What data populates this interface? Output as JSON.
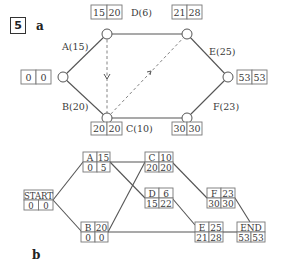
{
  "question_number": "5",
  "part_a": {
    "label": "a",
    "events": [
      {
        "id": "start",
        "early": "0",
        "late": "0"
      },
      {
        "id": "top-left",
        "early": "15",
        "late": "20"
      },
      {
        "id": "top-right",
        "early": "21",
        "late": "28"
      },
      {
        "id": "bottom-left",
        "early": "20",
        "late": "20"
      },
      {
        "id": "bottom-right",
        "early": "30",
        "late": "30"
      },
      {
        "id": "end",
        "early": "53",
        "late": "53"
      }
    ],
    "activities": [
      {
        "label": "A(15)",
        "from": "start",
        "to": "top-left"
      },
      {
        "label": "B(20)",
        "from": "start",
        "to": "bottom-left"
      },
      {
        "label": "D(6)",
        "from": "top-left",
        "to": "top-right"
      },
      {
        "label": "C(10)",
        "from": "bottom-left",
        "to": "bottom-right"
      },
      {
        "label": "E(25)",
        "from": "top-right",
        "to": "end"
      },
      {
        "label": "F(23)",
        "from": "bottom-right",
        "to": "end"
      }
    ],
    "dummies": [
      {
        "from": "top-left",
        "to": "bottom-left"
      },
      {
        "from": "bottom-left",
        "to": "top-right"
      }
    ]
  },
  "part_b": {
    "label": "b",
    "nodes": {
      "start": {
        "name": "START",
        "duration": "",
        "est": "0",
        "lst": "0"
      },
      "a": {
        "name": "A",
        "duration": "15",
        "est": "0",
        "lst": "5"
      },
      "b": {
        "name": "B",
        "duration": "20",
        "est": "0",
        "lst": "0"
      },
      "c": {
        "name": "C",
        "duration": "10",
        "est": "20",
        "lst": "20"
      },
      "d": {
        "name": "D",
        "duration": "6",
        "est": "15",
        "lst": "22"
      },
      "e": {
        "name": "E",
        "duration": "25",
        "est": "21",
        "lst": "28"
      },
      "f": {
        "name": "F",
        "duration": "23",
        "est": "30",
        "lst": "30"
      },
      "end": {
        "name": "END",
        "duration": "",
        "est": "53",
        "lst": "53"
      }
    }
  }
}
